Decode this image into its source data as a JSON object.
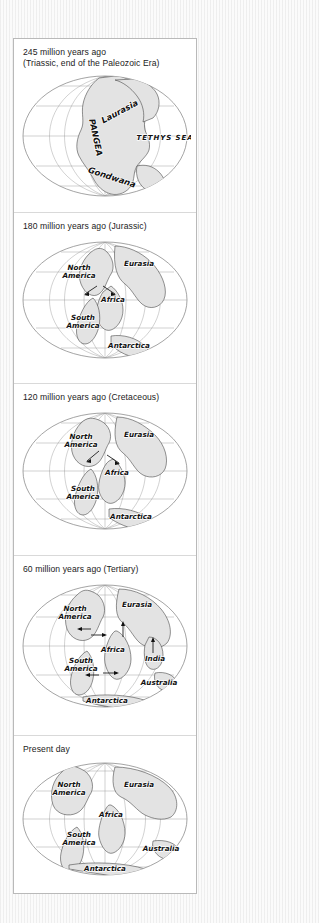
{
  "figure": {
    "title_text": "Continental drift through geologic time",
    "panels": [
      {
        "id": "panel-245ma",
        "caption": "245 million years ago\n(Triassic, end of the Paleozoic Era)",
        "age_ma": 245,
        "period": "Triassic, end of the Paleozoic Era",
        "labels": [
          "Laurasia",
          "PANGEA",
          "Gondwana",
          "TETHYS SEA"
        ],
        "arrows": 0
      },
      {
        "id": "panel-180ma",
        "caption": "180 million years ago (Jurassic)",
        "age_ma": 180,
        "period": "Jurassic",
        "labels": [
          "North America",
          "Eurasia",
          "Africa",
          "South America",
          "Antarctica"
        ],
        "arrows": 2
      },
      {
        "id": "panel-120ma",
        "caption": "120 million years ago (Cretaceous)",
        "age_ma": 120,
        "period": "Cretaceous",
        "labels": [
          "North America",
          "Eurasia",
          "Africa",
          "South America",
          "Antarctica"
        ],
        "arrows": 2
      },
      {
        "id": "panel-60ma",
        "caption": "60 million years ago (Tertiary)",
        "age_ma": 60,
        "period": "Tertiary",
        "labels": [
          "North America",
          "Eurasia",
          "Africa",
          "India",
          "South America",
          "Australia",
          "Antarctica"
        ],
        "arrows": 7
      },
      {
        "id": "panel-present",
        "caption": "Present day",
        "age_ma": 0,
        "period": "Present day",
        "labels": [
          "North America",
          "Eurasia",
          "Africa",
          "South America",
          "Australia",
          "Antarctica"
        ],
        "arrows": 0
      }
    ]
  },
  "map_labels": {
    "laurasia": "Laurasia",
    "pangea": "PANGEA",
    "gondwana": "Gondwana",
    "tethys_sea": "TETHYS SEA",
    "north_america_1": "North",
    "north_america_2": "America",
    "south_america_1": "South",
    "south_america_2": "America",
    "eurasia": "Eurasia",
    "africa": "Africa",
    "antarctica": "Antarctica",
    "india": "India",
    "australia": "Australia"
  },
  "colors": {
    "page_background": "#fbfbfb",
    "panel_background": "#ffffff",
    "panel_border": "#b9b9b9",
    "separator": "#d9d9d9",
    "land_fill": "#e3e3e3",
    "land_stroke": "#3a3a3a",
    "graticule": "#9a9a9a",
    "caption_text": "#1b1b1b"
  }
}
